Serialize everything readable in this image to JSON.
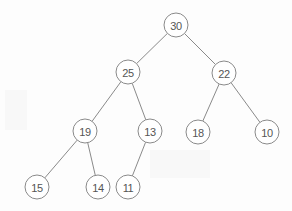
{
  "diagram": {
    "type": "binary-tree",
    "background_color": "#fdfdfd",
    "node_fill": "#ffffff",
    "node_stroke": "#8a8a8a",
    "edge_color": "#8a8a8a",
    "label_color": "#555555",
    "node_radius": 12,
    "nodes": [
      {
        "id": "n30",
        "label": "30",
        "x": 176,
        "y": 25,
        "level": 0
      },
      {
        "id": "n25",
        "label": "25",
        "x": 128,
        "y": 72,
        "level": 1
      },
      {
        "id": "n22",
        "label": "22",
        "x": 224,
        "y": 73,
        "level": 1
      },
      {
        "id": "n19",
        "label": "19",
        "x": 85,
        "y": 131,
        "level": 2
      },
      {
        "id": "n13",
        "label": "13",
        "x": 150,
        "y": 131,
        "level": 2
      },
      {
        "id": "n18",
        "label": "18",
        "x": 198,
        "y": 132,
        "level": 2
      },
      {
        "id": "n10",
        "label": "10",
        "x": 267,
        "y": 132,
        "level": 2
      },
      {
        "id": "n15",
        "label": "15",
        "x": 37,
        "y": 187,
        "level": 3
      },
      {
        "id": "n14",
        "label": "14",
        "x": 98,
        "y": 187,
        "level": 3
      },
      {
        "id": "n11",
        "label": "11",
        "x": 128,
        "y": 187,
        "level": 3
      }
    ],
    "edges": [
      {
        "from": "n30",
        "to": "n25",
        "side": "left"
      },
      {
        "from": "n30",
        "to": "n22",
        "side": "right"
      },
      {
        "from": "n25",
        "to": "n19",
        "side": "left"
      },
      {
        "from": "n25",
        "to": "n13",
        "side": "right"
      },
      {
        "from": "n22",
        "to": "n18",
        "side": "left"
      },
      {
        "from": "n22",
        "to": "n10",
        "side": "right"
      },
      {
        "from": "n19",
        "to": "n15",
        "side": "left"
      },
      {
        "from": "n19",
        "to": "n14",
        "side": "right"
      },
      {
        "from": "n13",
        "to": "n11",
        "side": "left"
      }
    ]
  }
}
